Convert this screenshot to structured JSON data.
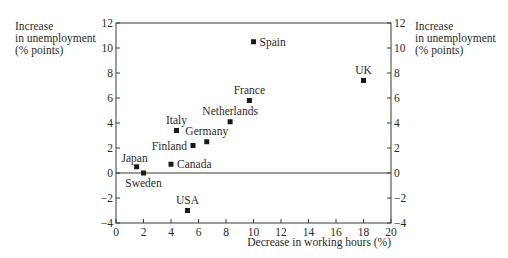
{
  "chart_data": {
    "type": "scatter",
    "title": "",
    "xlabel": "Decrease in working hours (%)",
    "ylabel": [
      "Increase",
      "in unemployment",
      "(% points)"
    ],
    "ylabel_right": [
      "Increase",
      "in unemployment",
      "(% points)"
    ],
    "xlim": [
      0,
      20
    ],
    "ylim": [
      -4,
      12
    ],
    "xticks": [
      0,
      2,
      4,
      6,
      8,
      10,
      12,
      14,
      16,
      18,
      20
    ],
    "yticks": [
      -4,
      -2,
      0,
      2,
      4,
      6,
      8,
      10,
      12
    ],
    "zero_line": true,
    "grid": false,
    "legend": null,
    "points": [
      {
        "label": "Japan",
        "x": 1.5,
        "y": 0.5,
        "label_pos": "above-left"
      },
      {
        "label": "Sweden",
        "x": 2.0,
        "y": 0.0,
        "label_pos": "below"
      },
      {
        "label": "Canada",
        "x": 4.0,
        "y": 0.7,
        "label_pos": "right"
      },
      {
        "label": "Italy",
        "x": 4.4,
        "y": 3.4,
        "label_pos": "above"
      },
      {
        "label": "Finland",
        "x": 5.6,
        "y": 2.2,
        "label_pos": "left"
      },
      {
        "label": "USA",
        "x": 5.2,
        "y": -3.0,
        "label_pos": "above"
      },
      {
        "label": "Germany",
        "x": 6.6,
        "y": 2.5,
        "label_pos": "above"
      },
      {
        "label": "Netherlands",
        "x": 8.3,
        "y": 4.1,
        "label_pos": "above"
      },
      {
        "label": "France",
        "x": 9.7,
        "y": 5.8,
        "label_pos": "above"
      },
      {
        "label": "Spain",
        "x": 10.0,
        "y": 10.5,
        "label_pos": "right"
      },
      {
        "label": "UK",
        "x": 18.0,
        "y": 7.4,
        "label_pos": "above"
      }
    ]
  },
  "colors": {
    "axis": "#3a3a3a",
    "marker": "#1a1a1a",
    "text": "#2a2a2a"
  }
}
